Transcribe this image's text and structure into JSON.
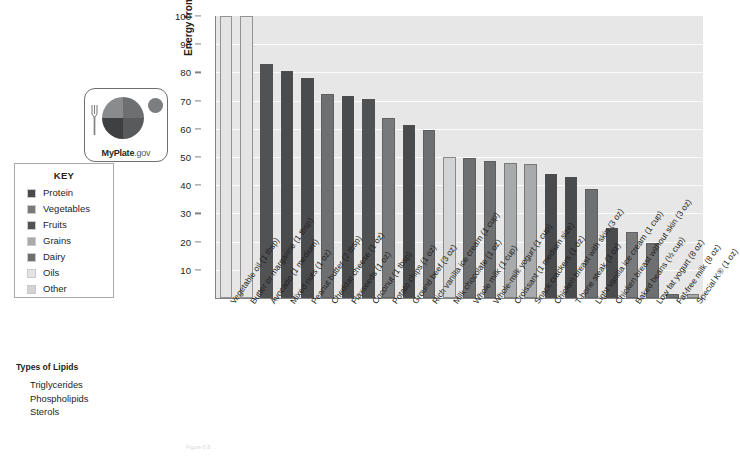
{
  "legend": {
    "title": "KEY",
    "items": [
      {
        "label": "Protein",
        "color": "#4a4b4d"
      },
      {
        "label": "Vegetables",
        "color": "#78797b"
      },
      {
        "label": "Fruits",
        "color": "#515254"
      },
      {
        "label": "Grains",
        "color": "#a9aaac"
      },
      {
        "label": "Dairy",
        "color": "#6e6f71"
      },
      {
        "label": "Oils",
        "color": "#e4e4e5"
      },
      {
        "label": "Other",
        "color": "#d2d3d4"
      }
    ]
  },
  "logo": {
    "brand_bold": "MyPlate",
    "brand_light": ".gov",
    "fork_icon": "fork-icon",
    "plate_icon": "plate-icon",
    "cup_icon": "dairy-cup-icon"
  },
  "lipids": {
    "title": "Types of Lipids",
    "items": [
      "Triglycerides",
      "Phospholipids",
      "Sterols"
    ]
  },
  "caption": "Figure 6.8 ...",
  "chart_data": {
    "type": "bar",
    "title": "",
    "xlabel": "",
    "ylabel": "Energy from fat (%)",
    "ylim": [
      0,
      100
    ],
    "yticks": [
      10,
      20,
      30,
      40,
      50,
      60,
      70,
      80,
      90,
      100
    ],
    "grid": true,
    "legend_position": "left",
    "categories": [
      "Vegetable oil (1 tbsp)",
      "Butter or margarine (1 tbsp)",
      "Avocado (1 medium)",
      "Mixed nuts (1 oz)",
      "Peanut butter (2 tbsp)",
      "Cheddar cheese (1 oz)",
      "Flaxseeds (1 oz)",
      "Coconut (1 tbsp)",
      "Potato chips (1 oz)",
      "Ground beef (3 oz)",
      "Rich vanilla ice cream (1 cup)",
      "Milk chocolate (1 oz)",
      "Whole milk (1 cup)",
      "Whole-milk yogurt (1 cup)",
      "Croissant (1 medium size)",
      "Snack crackers (1 oz)",
      "Chicken breast with skin (3 oz)",
      "T-bone steak (3 oz)",
      "Light vanilla ice cream (1 cup)",
      "Chicken breast without skin (3 oz)",
      "Baked beans (½ cup)",
      "Low fat yogurt (8 oz)",
      "Fat-free milk (8 oz)",
      "Special K® (1 oz)"
    ],
    "values": [
      100,
      100,
      83,
      80.5,
      78,
      72.5,
      71.5,
      70.5,
      64,
      61.5,
      59.5,
      50,
      49.5,
      48.5,
      48,
      47.5,
      44,
      43,
      38.5,
      25,
      23.5,
      19.5,
      1.5,
      1.5
    ],
    "bar_groups": [
      "Oils",
      "Oils",
      "Fruits",
      "Protein",
      "Protein",
      "Dairy",
      "Protein",
      "Fruits",
      "Vegetables",
      "Protein",
      "Dairy",
      "Other",
      "Dairy",
      "Dairy",
      "Grains",
      "Grains",
      "Protein",
      "Protein",
      "Dairy",
      "Protein",
      "Vegetables",
      "Dairy",
      "Dairy",
      "Grains"
    ],
    "bar_colors": [
      "#e4e4e5",
      "#e4e4e5",
      "#515254",
      "#4a4b4d",
      "#4a4b4d",
      "#6e6f71",
      "#4a4b4d",
      "#515254",
      "#78797b",
      "#4a4b4d",
      "#6e6f71",
      "#d2d3d4",
      "#6e6f71",
      "#6e6f71",
      "#a9aaac",
      "#a9aaac",
      "#4a4b4d",
      "#4a4b4d",
      "#6e6f71",
      "#4a4b4d",
      "#78797b",
      "#6e6f71",
      "#6e6f71",
      "#a9aaac"
    ]
  }
}
